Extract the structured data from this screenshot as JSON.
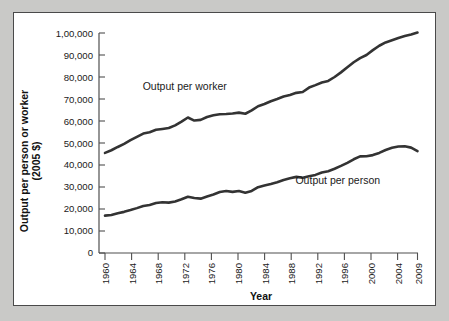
{
  "figure": {
    "background_color": "#c9c9c7",
    "panel_color": "#ffffff",
    "line_color": "#333333",
    "axis_color": "#4f4f4f",
    "text_color": "#1a1a1a"
  },
  "chart_data": {
    "type": "line",
    "title": "",
    "xlabel": "Year",
    "ylabel": "Output per person or worker\n(2005 $)",
    "ylabel_line1": "Output per person or worker",
    "ylabel_line2": "(2005 $)",
    "grid": false,
    "legend_position": "inline-annotation",
    "xlim": [
      1960,
      2009
    ],
    "ylim": [
      0,
      100000
    ],
    "xticks": [
      1960,
      1964,
      1968,
      1972,
      1976,
      1980,
      1984,
      1988,
      1992,
      1996,
      2000,
      2004,
      2009
    ],
    "xtick_labels": [
      "1960",
      "1964",
      "1968",
      "1972",
      "1976",
      "1980",
      "1984",
      "1988",
      "1992",
      "1996",
      "2000",
      "2004",
      "2009"
    ],
    "yticks": [
      0,
      10000,
      20000,
      30000,
      40000,
      50000,
      60000,
      70000,
      80000,
      90000,
      100000
    ],
    "ytick_labels": [
      "0",
      "10,000",
      "20,000",
      "30,000",
      "40,000",
      "50,000",
      "60,000",
      "70,000",
      "80,000",
      "90,000",
      "1,00,000"
    ],
    "x": [
      1960,
      1961,
      1962,
      1963,
      1964,
      1965,
      1966,
      1967,
      1968,
      1969,
      1970,
      1971,
      1972,
      1973,
      1974,
      1975,
      1976,
      1977,
      1978,
      1979,
      1980,
      1981,
      1982,
      1983,
      1984,
      1985,
      1986,
      1987,
      1988,
      1989,
      1990,
      1991,
      1992,
      1993,
      1994,
      1995,
      1996,
      1997,
      1998,
      1999,
      2000,
      2001,
      2002,
      2003,
      2004,
      2005,
      2006,
      2007,
      2008,
      2009
    ],
    "series": [
      {
        "name": "Output per worker",
        "label": "Output per worker",
        "label_x": 1972.5,
        "label_y": 74000,
        "values": [
          45500,
          46700,
          48200,
          49600,
          51300,
          52800,
          54300,
          54900,
          56000,
          56400,
          56800,
          58000,
          59700,
          61600,
          60200,
          60500,
          61800,
          62600,
          63100,
          63200,
          63400,
          63800,
          63300,
          64800,
          66700,
          67700,
          69000,
          70000,
          71100,
          71800,
          72800,
          73200,
          75200,
          76300,
          77500,
          78200,
          80000,
          82100,
          84400,
          86700,
          88600,
          90000,
          92200,
          94200,
          95700,
          96700,
          97700,
          98600,
          99300,
          100200
        ]
      },
      {
        "name": "Output per person",
        "label": "Output per person",
        "label_x": 1996.5,
        "label_y": 31500,
        "values": [
          17000,
          17300,
          18100,
          18700,
          19500,
          20400,
          21400,
          21800,
          22700,
          23100,
          22900,
          23400,
          24400,
          25600,
          25000,
          24700,
          25700,
          26600,
          27700,
          28200,
          27800,
          28200,
          27400,
          28200,
          29900,
          30700,
          31400,
          32200,
          33200,
          34000,
          34600,
          34200,
          34900,
          35500,
          36600,
          37200,
          38300,
          39600,
          41000,
          42600,
          43900,
          44000,
          44500,
          45500,
          46800,
          47800,
          48400,
          48500,
          47900,
          46300
        ]
      }
    ]
  },
  "ghost_caption": ""
}
